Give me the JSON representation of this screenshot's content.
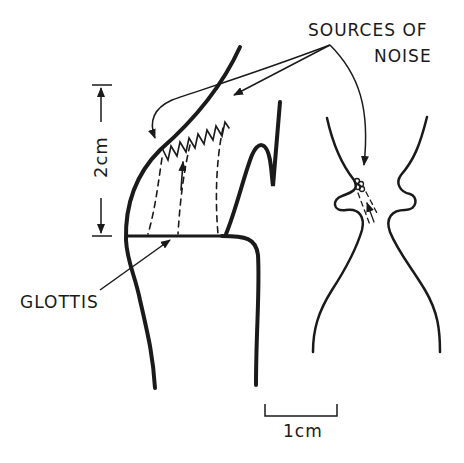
{
  "labels": {
    "sources_line1": "SOURCES OF",
    "sources_line2": "NOISE",
    "glottis": "GLOTTIS",
    "vertical_scale": "2cm",
    "horizontal_scale": "1cm"
  },
  "colors": {
    "ink": "#1a1a1a",
    "background": "#ffffff"
  },
  "figure": {
    "left_panel": "midsagittal vocal tract profile with glottis, dashed airflow lines and zigzag turbulence source",
    "right_panel": "coronal section of larynx with noise source near constriction"
  }
}
